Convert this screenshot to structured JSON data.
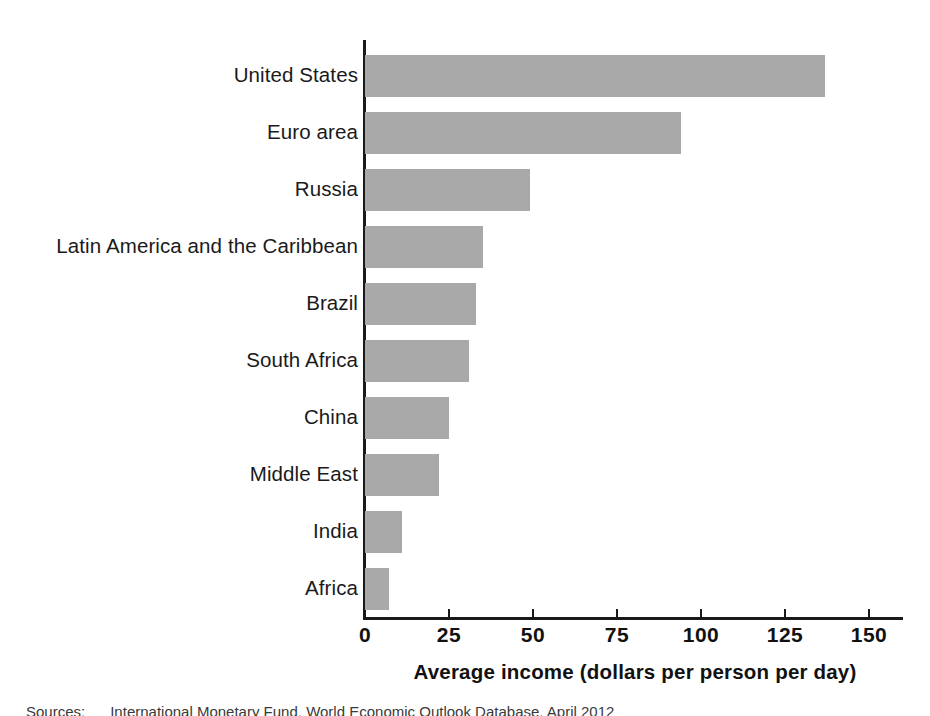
{
  "figure": {
    "background_color": "#ffffff",
    "bar_color": "#a9a9a9",
    "axis_color": "#1a1a1a",
    "source_note": "Sources:      International Monetary Fund, World Economic Outlook Database, April 2012"
  },
  "chart_data": {
    "type": "bar",
    "orientation": "horizontal",
    "title": "",
    "xlabel": "Average income (dollars per person per day)",
    "ylabel": "",
    "xlim": [
      0,
      162
    ],
    "xticks": [
      0,
      25,
      50,
      75,
      100,
      125,
      150
    ],
    "xtick_labels": [
      "0",
      "25",
      "50",
      "75",
      "100",
      "125",
      "150"
    ],
    "grid": false,
    "legend": false,
    "categories": [
      "United States",
      "Euro area",
      "Russia",
      "Latin America and the Caribbean",
      "Brazil",
      "South Africa",
      "China",
      "Middle East",
      "India",
      "Africa"
    ],
    "values": [
      137,
      94,
      49,
      35,
      33,
      31,
      25,
      22,
      11,
      7
    ],
    "series": [
      {
        "name": "Average income (dollars per person per day)",
        "values": [
          137,
          94,
          49,
          35,
          33,
          31,
          25,
          22,
          11,
          7
        ]
      }
    ]
  }
}
